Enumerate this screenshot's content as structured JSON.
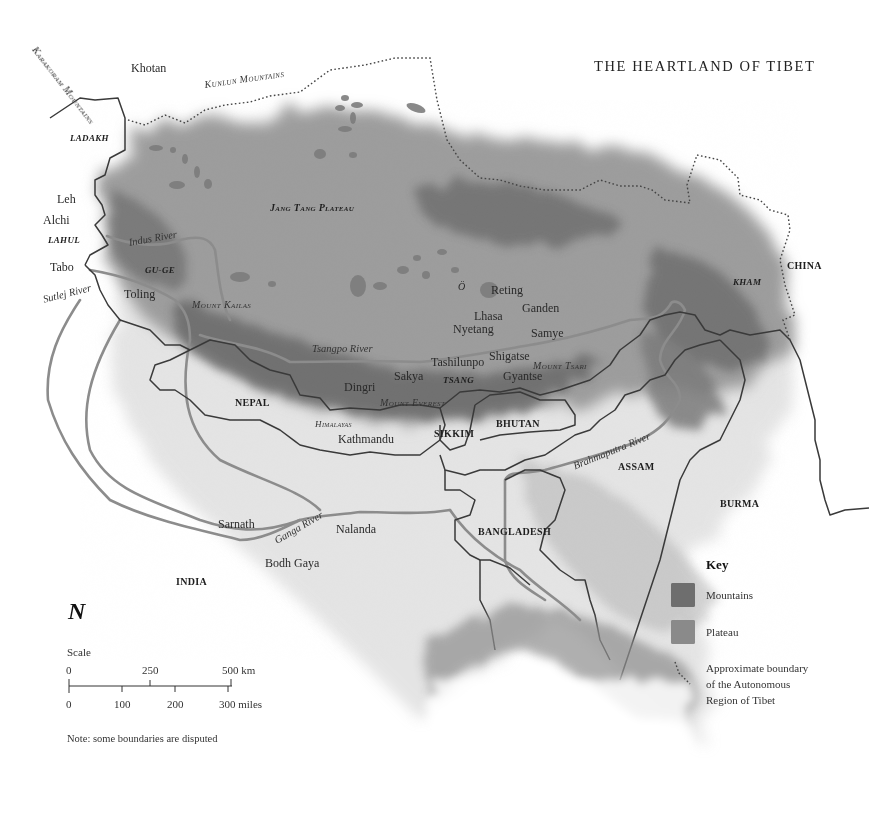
{
  "title": "THE HEARTLAND OF TIBET",
  "colors": {
    "mountains": "#6e6e6e",
    "plateau": "#8a8a8a",
    "border": "#3a3a3a",
    "river": "#8c8c8c",
    "background": "#ffffff"
  },
  "labels": {
    "places": {
      "khotan": "Khotan",
      "leh": "Leh",
      "alchi": "Alchi",
      "tabo": "Tabo",
      "toling": "Toling",
      "o": "Ö",
      "reting": "Reting",
      "ganden": "Ganden",
      "lhasa": "Lhasa",
      "nyetang": "Nyetang",
      "samye": "Samye",
      "tashilunpo": "Tashilunpo",
      "shigatse": "Shigatse",
      "sakya": "Sakya",
      "gyantse": "Gyantse",
      "dingri": "Dingri",
      "kathmandu": "Kathmandu",
      "sarnath": "Sarnath",
      "nalanda": "Nalanda",
      "bodh_gaya": "Bodh Gaya"
    },
    "countries": {
      "nepal": "NEPAL",
      "bhutan": "BHUTAN",
      "sikkim": "SIKKIM",
      "assam": "ASSAM",
      "china": "CHINA",
      "burma": "BURMA",
      "bangladesh": "BANGLADESH",
      "india": "INDIA"
    },
    "regions": {
      "ladakh": "LADAKH",
      "lahul": "LAHUL",
      "guge": "GU-GE",
      "tsang": "TSANG",
      "kham": "KHAM",
      "jang_tang": "Jang Tang Plateau"
    },
    "features": {
      "karakoram": "Karakoram Mountains",
      "kunlun": "Kunlun Mountains",
      "kailas": "Mount Kailas",
      "everest": "Mount Everest",
      "tsari": "Mount Tsari",
      "himalayas": "Himalayas"
    },
    "rivers": {
      "indus": "Indus River",
      "sutlej": "Sutlej River",
      "tsangpo": "Tsangpo River",
      "ganga": "Ganga River",
      "brahmaputra": "Brahmaputra River"
    }
  },
  "compass": {
    "label": "N"
  },
  "scale": {
    "title": "Scale",
    "km_ticks": [
      "0",
      "250",
      "500 km"
    ],
    "mile_ticks": [
      "0",
      "100",
      "200",
      "300 miles"
    ]
  },
  "note": "Note: some boundaries are disputed",
  "key": {
    "title": "Key",
    "items": [
      {
        "label": "Mountains",
        "type": "swatch"
      },
      {
        "label": "Plateau",
        "type": "swatch"
      },
      {
        "label_lines": [
          "Approximate boundary",
          "of the Autonomous",
          "Region of Tibet"
        ],
        "type": "dotted-line"
      }
    ]
  }
}
